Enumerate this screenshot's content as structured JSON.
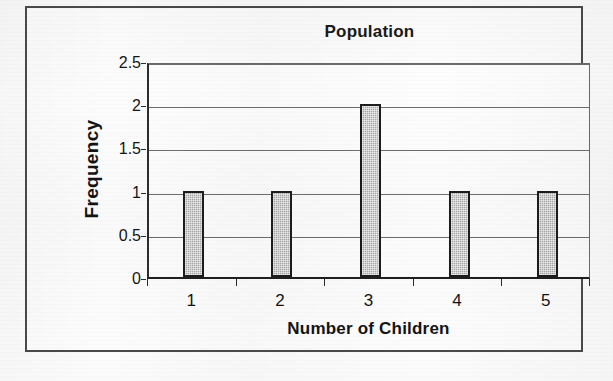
{
  "chart_data": {
    "type": "bar",
    "title": "Population",
    "xlabel": "Number of Children",
    "ylabel": "Frequency",
    "categories": [
      "1",
      "2",
      "3",
      "4",
      "5"
    ],
    "values": [
      1,
      1,
      2,
      1,
      1
    ],
    "ylim": [
      0,
      2.5
    ],
    "yticks": [
      "0",
      "0.5",
      "1",
      "1.5",
      "2",
      "2.5"
    ],
    "ytick_values": [
      0,
      0.5,
      1,
      1.5,
      2,
      2.5
    ],
    "grid": true,
    "legend": false,
    "legend_position": "none",
    "bar_fill_color": "#a8a8a8",
    "bar_border_color": "#1c1c1c",
    "plot_background": "#fdfdfd",
    "axis_color": "#2c2c2c",
    "gridline_color": "#6e6e6e",
    "frame_color": "#4a4a4a",
    "series": [
      {
        "name": "Frequency",
        "values": [
          1,
          1,
          2,
          1,
          1
        ]
      }
    ]
  }
}
